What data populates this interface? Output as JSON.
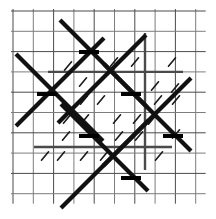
{
  "figure": {
    "width": 216,
    "height": 219,
    "background_color": "#ffffff"
  },
  "colors": {
    "background": "#ffffff",
    "grid_line": "#4a4a4a",
    "grid_line_light": "#7d7d7d",
    "diagonal_line": "#111111",
    "tick_mark": "#1a1a1a",
    "crossing_bar": "#000000"
  },
  "grid": {
    "label": "square grid",
    "origin_x": 13,
    "origin_y": 11,
    "spacing": 20.3,
    "columns": 10,
    "rows": 10,
    "line_width": 1,
    "vertical_x": [
      13,
      33.3,
      53.6,
      73.9,
      94.2,
      114.5,
      134.8,
      155.1,
      175.4,
      195.7
    ],
    "horizontal_y": [
      11,
      31.3,
      51.6,
      71.9,
      92.2,
      112.5,
      132.8,
      153.1,
      173.4,
      193.7
    ]
  },
  "heavy_grid_segments": [
    {
      "name": "heavy-horizontal-upper",
      "x1": 48,
      "y1": 71.9,
      "x2": 183,
      "y2": 71.9,
      "width": 2.4
    },
    {
      "name": "heavy-horizontal-lower",
      "x1": 34,
      "y1": 147,
      "x2": 172,
      "y2": 147,
      "width": 2.4
    },
    {
      "name": "heavy-vertical-center",
      "x1": 145,
      "y1": 33,
      "x2": 145,
      "y2": 170,
      "width": 2.4
    }
  ],
  "diagonals": {
    "line_width": 4.2,
    "down_right": [
      {
        "name": "diagonal-dr-1",
        "x1": 60,
        "y1": 20,
        "x2": 147,
        "y2": 107
      },
      {
        "name": "diagonal-dr-2",
        "x1": 16,
        "y1": 54,
        "x2": 103,
        "y2": 141
      },
      {
        "name": "diagonal-dr-3",
        "x1": 104,
        "y1": 64,
        "x2": 191,
        "y2": 151
      },
      {
        "name": "diagonal-dr-4",
        "x1": 61,
        "y1": 104,
        "x2": 148,
        "y2": 191
      }
    ],
    "up_right": [
      {
        "name": "diagonal-ur-1",
        "x1": 58,
        "y1": 123,
        "x2": 146,
        "y2": 35
      },
      {
        "name": "diagonal-ur-2",
        "x1": 16,
        "y1": 126,
        "x2": 104,
        "y2": 38
      },
      {
        "name": "diagonal-ur-3",
        "x1": 103,
        "y1": 166,
        "x2": 191,
        "y2": 78
      },
      {
        "name": "diagonal-ur-4",
        "x1": 61,
        "y1": 208,
        "x2": 149,
        "y2": 120
      }
    ]
  },
  "crossings": [
    {
      "name": "crossing-top",
      "x": 89,
      "y": 52,
      "bar_half_width": 10
    },
    {
      "name": "crossing-left",
      "x": 47,
      "y": 94,
      "bar_half_width": 10
    },
    {
      "name": "crossing-center-right",
      "x": 131,
      "y": 94,
      "bar_half_width": 10
    },
    {
      "name": "crossing-center-left",
      "x": 89,
      "y": 136,
      "bar_half_width": 10
    },
    {
      "name": "crossing-right",
      "x": 173,
      "y": 136,
      "bar_half_width": 10
    },
    {
      "name": "crossing-bottom",
      "x": 131,
      "y": 178,
      "bar_half_width": 10
    }
  ],
  "tick_marks": {
    "label": "hash mark",
    "length": 11,
    "angle_deg": -50,
    "line_width": 1.6,
    "positions": [
      {
        "x": 68,
        "y": 66
      },
      {
        "x": 114,
        "y": 62
      },
      {
        "x": 135,
        "y": 62
      },
      {
        "x": 172,
        "y": 62
      },
      {
        "x": 83,
        "y": 82
      },
      {
        "x": 99,
        "y": 82
      },
      {
        "x": 155,
        "y": 86
      },
      {
        "x": 175,
        "y": 88
      },
      {
        "x": 84,
        "y": 100
      },
      {
        "x": 101,
        "y": 100
      },
      {
        "x": 158,
        "y": 100
      },
      {
        "x": 176,
        "y": 100
      },
      {
        "x": 67,
        "y": 119
      },
      {
        "x": 85,
        "y": 119
      },
      {
        "x": 117,
        "y": 119
      },
      {
        "x": 137,
        "y": 119
      },
      {
        "x": 66,
        "y": 136
      },
      {
        "x": 119,
        "y": 136
      },
      {
        "x": 139,
        "y": 136
      },
      {
        "x": 176,
        "y": 134
      },
      {
        "x": 84,
        "y": 156
      },
      {
        "x": 104,
        "y": 156
      },
      {
        "x": 159,
        "y": 156
      },
      {
        "x": 45,
        "y": 156
      },
      {
        "x": 61,
        "y": 156
      },
      {
        "x": 152,
        "y": 120
      }
    ]
  }
}
